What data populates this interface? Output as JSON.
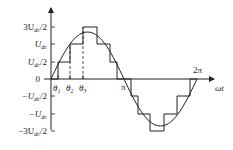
{
  "diagram": {
    "y_axis": {
      "labels": [
        {
          "id": "p3",
          "text": "3U",
          "sub": "dc",
          "suffix": "/2"
        },
        {
          "id": "p2",
          "text": "U",
          "sub": "dc",
          "suffix": ""
        },
        {
          "id": "p1",
          "text": "U",
          "sub": "dc",
          "suffix": "/2"
        },
        {
          "id": "z",
          "text": "0",
          "sub": "",
          "suffix": ""
        },
        {
          "id": "n1",
          "text": "−U",
          "sub": "dc",
          "suffix": "/2"
        },
        {
          "id": "n2",
          "text": "−U",
          "sub": "dc",
          "suffix": ""
        },
        {
          "id": "n3",
          "text": "−3U",
          "sub": "dc",
          "suffix": "/2"
        }
      ]
    },
    "x_axis": {
      "label": "ωt",
      "ticks": [
        "θ1",
        "θ2",
        "θ3",
        "π",
        "2π"
      ],
      "theta1": "θ",
      "theta1_sub": "1",
      "theta2": "θ",
      "theta2_sub": "2",
      "theta3": "θ",
      "theta3_sub": "3",
      "pi": "π",
      "two_pi": "2π"
    },
    "colors": {
      "line": "#222222",
      "background": "#ffffff"
    }
  }
}
